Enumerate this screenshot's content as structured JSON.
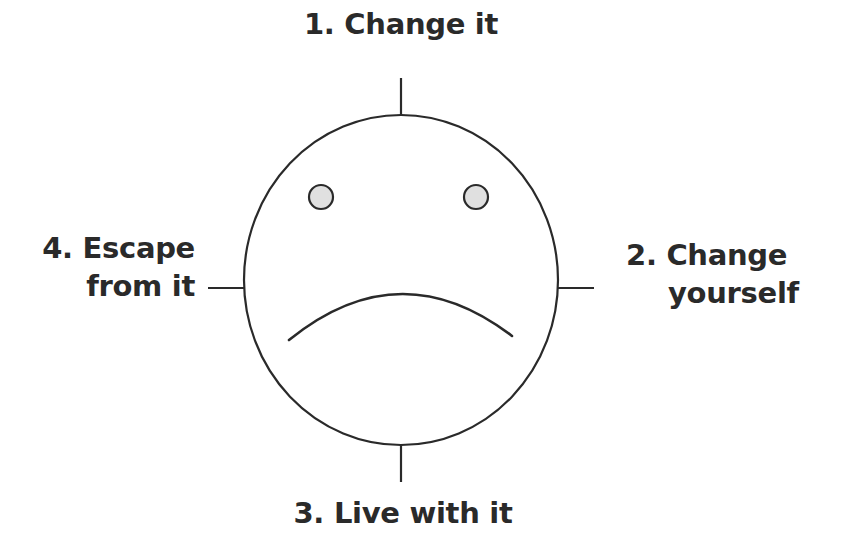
{
  "diagram": {
    "type": "sad-face-with-four-options",
    "colors": {
      "stroke": "#2a2a2a",
      "eye_fill": "#e0e0e0",
      "background": "#ffffff",
      "text": "#2a2a2a"
    },
    "options": {
      "top": {
        "number": "1.",
        "lines": [
          "1. Change it"
        ]
      },
      "right": {
        "number": "2.",
        "lines": [
          "2. Change",
          "yourself"
        ]
      },
      "bottom": {
        "number": "3.",
        "lines": [
          "3. Live with it"
        ]
      },
      "left": {
        "number": "4.",
        "lines": [
          "4. Escape",
          "from it"
        ]
      }
    },
    "face": {
      "expression": "sad",
      "eyes": 2,
      "mouth": "frown"
    }
  }
}
